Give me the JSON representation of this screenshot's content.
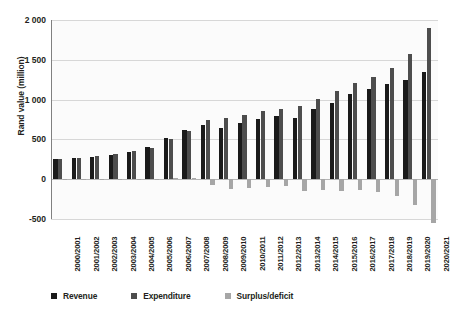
{
  "chart_data": {
    "type": "bar",
    "title": "",
    "xlabel": "",
    "ylabel": "Rand value (million)",
    "ylim": [
      -500,
      2000
    ],
    "yticks": [
      2000,
      1500,
      1000,
      500,
      0,
      -500
    ],
    "ytick_labels": [
      "2 000",
      "1 500",
      "1 000",
      "500",
      "0",
      "-500"
    ],
    "grid": true,
    "legend_position": "bottom",
    "categories": [
      "2000/2001",
      "2001/2002",
      "2002/2003",
      "2003/2004",
      "2004/2005",
      "2005/2006",
      "2006/2007",
      "2007/2008",
      "2008/2009",
      "2009/2010",
      "2010/2011",
      "2011/2012",
      "2012/2013",
      "2013/2014",
      "2014/2015",
      "2015/2016",
      "2016/2017",
      "2017/2018",
      "2018/2019",
      "2019/2020",
      "2020/2021"
    ],
    "series": [
      {
        "name": "Revenue",
        "color": "#1a1a1a",
        "values": [
          255,
          270,
          282,
          300,
          345,
          400,
          520,
          615,
          675,
          640,
          700,
          760,
          790,
          770,
          880,
          960,
          1070,
          1130,
          1190,
          1240,
          1350
        ]
      },
      {
        "name": "Expenditure",
        "color": "#4d4d4d",
        "values": [
          250,
          268,
          290,
          312,
          355,
          395,
          510,
          600,
          745,
          765,
          810,
          855,
          880,
          920,
          1010,
          1105,
          1210,
          1290,
          1400,
          1570,
          1900
        ]
      },
      {
        "name": "Surplus/deficit",
        "color": "#a6a6a6",
        "values": [
          5,
          2,
          -8,
          -12,
          -10,
          5,
          10,
          15,
          -70,
          -125,
          -110,
          -95,
          -90,
          -150,
          -130,
          -145,
          -140,
          -160,
          -210,
          -330,
          -550
        ]
      }
    ]
  },
  "legend": {
    "items": [
      {
        "label": "Revenue",
        "color": "#1a1a1a",
        "swatch": "square-marker"
      },
      {
        "label": "Expenditure",
        "color": "#4d4d4d",
        "swatch": "square-marker"
      },
      {
        "label": "Surplus/deficit",
        "color": "#a6a6a6",
        "swatch": "square-marker"
      }
    ]
  }
}
